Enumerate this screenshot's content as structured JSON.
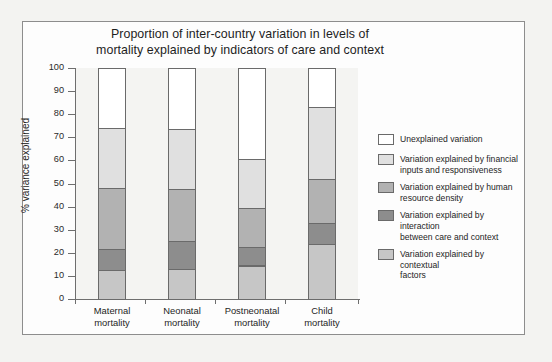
{
  "figure": {
    "title_line1": "Proportion of inter-country variation in levels of",
    "title_line2": "mortality explained by indicators of care and context"
  },
  "chart_data": {
    "type": "bar",
    "stacked": true,
    "title": "Proportion of inter-country variation in levels of mortality explained by indicators of care and context",
    "xlabel": "",
    "ylabel": "% variance explained",
    "ylim": [
      0,
      100
    ],
    "yticks": [
      0,
      10,
      20,
      30,
      40,
      50,
      60,
      70,
      80,
      90,
      100
    ],
    "grid": false,
    "legend_position": "right",
    "categories": [
      "Maternal mortality",
      "Neonatal mortality",
      "Postneonatal mortality",
      "Child mortality"
    ],
    "category_lines": [
      [
        "Maternal",
        "mortality"
      ],
      [
        "Neonatal",
        "mortality"
      ],
      [
        "Postneonatal",
        "mortality"
      ],
      [
        "Child",
        "mortality"
      ]
    ],
    "series": [
      {
        "name": "Variation explained by contextual factors",
        "color": "#c6c6c6",
        "values": [
          12.5,
          13.0,
          14.5,
          24.0
        ]
      },
      {
        "name": "Variation explained by interaction between care and context",
        "color": "#8d8d8d",
        "values": [
          9.0,
          12.0,
          8.0,
          9.0
        ]
      },
      {
        "name": "Variation explained by human resource density",
        "color": "#b2b2b2",
        "values": [
          26.5,
          22.5,
          17.0,
          19.0
        ]
      },
      {
        "name": "Variation explained by financial inputs and responsiveness",
        "color": "#e0e0e0",
        "values": [
          26.0,
          26.0,
          21.0,
          31.0
        ]
      },
      {
        "name": "Unexplained variation",
        "color": "#ffffff",
        "values": [
          26.0,
          26.5,
          39.5,
          17.0
        ]
      }
    ],
    "cumulative_boundaries": [
      [
        12.5,
        21.5,
        48.0,
        74.0,
        100.0
      ],
      [
        13.0,
        25.0,
        47.5,
        73.5,
        100.0
      ],
      [
        14.5,
        22.5,
        39.5,
        60.5,
        100.0
      ],
      [
        24.0,
        33.0,
        52.0,
        83.0,
        100.0
      ]
    ]
  },
  "legend": {
    "items": [
      {
        "color": "#ffffff",
        "lines": [
          "Unexplained variation"
        ]
      },
      {
        "color": "#e0e0e0",
        "lines": [
          "Variation explained by financial",
          "inputs and responsiveness"
        ]
      },
      {
        "color": "#b2b2b2",
        "lines": [
          "Variation explained by human",
          "resource density"
        ]
      },
      {
        "color": "#8d8d8d",
        "lines": [
          "Variation explained by interaction",
          "between care and context"
        ]
      },
      {
        "color": "#c6c6c6",
        "lines": [
          "Variation explained by contextual",
          "factors"
        ]
      }
    ]
  },
  "colors": {
    "axis": "#6e6e6e",
    "bar_outline": "#6a6a6a",
    "plot_background": "#f4f4f2",
    "page_background": "#f3f3f1",
    "frame": "#8d8d8d",
    "text": "#1e1e1e"
  }
}
